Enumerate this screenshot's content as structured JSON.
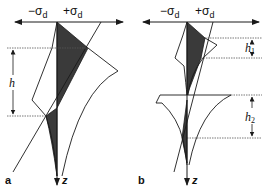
{
  "figure": {
    "panels": [
      {
        "id": "a",
        "label": "a",
        "axis_neg_label": "−σ",
        "axis_pos_label": "+σ",
        "axis_subscript": "d",
        "depth_axis_label": "z",
        "dimensions": [
          {
            "label": "h",
            "subscript": ""
          }
        ]
      },
      {
        "id": "b",
        "label": "b",
        "axis_neg_label": "−σ",
        "axis_pos_label": "+σ",
        "axis_subscript": "d",
        "depth_axis_label": "z",
        "dimensions": [
          {
            "label": "h",
            "subscript": "1"
          },
          {
            "label": "h",
            "subscript": "2"
          }
        ]
      }
    ],
    "colors": {
      "line": "#1a1a1a",
      "shade": "#3a3a3a",
      "dashed": "#555555"
    }
  }
}
